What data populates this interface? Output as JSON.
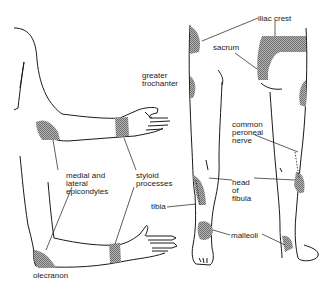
{
  "diagram": {
    "labels": {
      "iliac_crest": "iliac crest",
      "sacrum": "sacrum",
      "greater_trochanter": "greater\ntrochanter",
      "common_peroneal_nerve": "common\nperoneal\nnerve",
      "head_of_fibula": "head\nof\nfibula",
      "tibia": "tibia",
      "malleoli": "malleoli",
      "medial_lateral_epicondyles": "medial and\nlateral\nepicondyles",
      "styloid_processes": "styloid\nprocesses",
      "olecranon": "olecranon"
    },
    "colors": {
      "line": "#1a1a1a",
      "shade": "#8c8c8c",
      "background": "#ffffff"
    }
  }
}
